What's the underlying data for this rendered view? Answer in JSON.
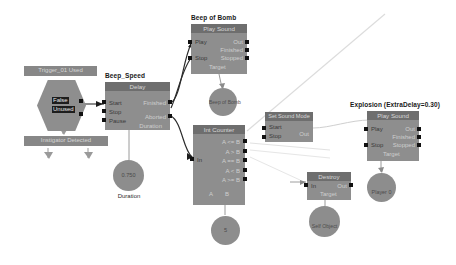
{
  "graph": {
    "title_bar_1": "Trigger_01 Used",
    "bottom_bar": "Instigator   Detected"
  },
  "nodes": {
    "trigger": {
      "title": "Trigger_01 Used",
      "out_false": "False",
      "out_unused": "Unused"
    },
    "beep_speed": {
      "title": "Beep_Speed",
      "header": "Delay",
      "in": [
        "Start",
        "Stop",
        "Pause"
      ],
      "out": [
        "Finished",
        "Aborted"
      ],
      "field": "Duration"
    },
    "beep_of_bomb": {
      "title": "Beep of Bomb",
      "header": "Play Sound",
      "in": [
        "Play",
        "Stop"
      ],
      "out": [
        "Out",
        "Finished",
        "Stopped"
      ],
      "field": "Target"
    },
    "int_counter": {
      "title": "Int Counter",
      "header": "Int Counter",
      "in": [
        "In"
      ],
      "out": [
        "A <= B",
        "A > B",
        "A == B",
        "A < B",
        "A >= B"
      ],
      "footer": [
        "A",
        "B"
      ]
    },
    "set_sound_mode": {
      "header": "Set Sound Mode",
      "in": [
        "Start",
        "Stop"
      ],
      "out": [
        "Out"
      ]
    },
    "explosion": {
      "title": "Explosion (ExtraDelay=0.30)",
      "header": "Play Sound",
      "in": [
        "Play",
        "Stop"
      ],
      "out": [
        "Out",
        "Finished",
        "Stopped"
      ],
      "field": "Target"
    },
    "destroy": {
      "header": "Destroy",
      "in": [
        "In"
      ],
      "out": [
        "Out"
      ],
      "field": "Target"
    }
  },
  "values": {
    "duration_value": "0.750",
    "duration_label": "Duration",
    "beep_sound_label": "Beep of Bomb",
    "counter_value": "5",
    "destroy_target": "Self Object",
    "explosion_target": "Player 0"
  },
  "colors": {
    "node_body": "#8e8e8e",
    "node_header": "#6e6e6e",
    "bar": "#878787",
    "port": "#111111",
    "wire": "#3a3a3a",
    "wire_faint": "#d8d8d8",
    "canvas": "#ffffff"
  }
}
